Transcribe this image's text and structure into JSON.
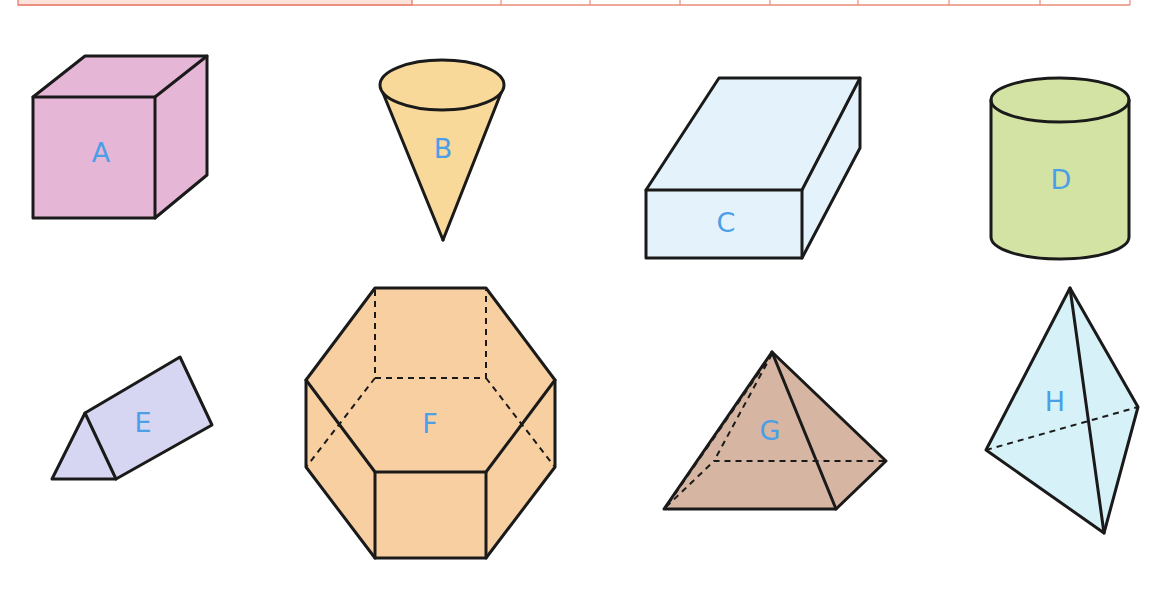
{
  "table": {
    "border_color": "#e98a7a",
    "first_cell_fill": "#fbe3dc",
    "column_dividers_x": [
      18,
      412,
      501,
      590,
      680,
      770,
      858,
      949,
      1040,
      1130
    ],
    "cells": [
      "",
      "",
      "",
      "",
      "",
      "",
      "",
      "",
      ""
    ]
  },
  "shapes": [
    {
      "id": "A",
      "label": "A",
      "type": "cube",
      "fill": "#e6b6d6"
    },
    {
      "id": "B",
      "label": "B",
      "type": "cone",
      "fill": "#f9d99a"
    },
    {
      "id": "C",
      "label": "C",
      "type": "rectangular-prism",
      "fill": "#e4f3fb"
    },
    {
      "id": "D",
      "label": "D",
      "type": "cylinder",
      "fill": "#d3e3a4"
    },
    {
      "id": "E",
      "label": "E",
      "type": "triangular-prism",
      "fill": "#d6d6f2"
    },
    {
      "id": "F",
      "label": "F",
      "type": "hexagonal-prism",
      "fill": "#f8cfa0"
    },
    {
      "id": "G",
      "label": "G",
      "type": "square-pyramid",
      "fill": "#d6b5a3"
    },
    {
      "id": "H",
      "label": "H",
      "type": "triangular-pyramid",
      "fill": "#d6f1f8"
    }
  ],
  "label_color": "#4a9fe6"
}
